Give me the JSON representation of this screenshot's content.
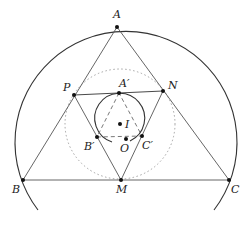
{
  "diagram": {
    "type": "geometry",
    "colors": {
      "stroke": "#333333",
      "dotted": "#999999",
      "point": "#111111"
    },
    "points": [
      {
        "id": "A",
        "label": "A",
        "x": 117,
        "y": 27,
        "lx": 113,
        "ly": 9
      },
      {
        "id": "B",
        "label": "B",
        "x": 23,
        "y": 180,
        "lx": 12,
        "ly": 184
      },
      {
        "id": "C",
        "label": "C",
        "x": 229,
        "y": 180,
        "lx": 231,
        "ly": 184
      },
      {
        "id": "M",
        "label": "M",
        "x": 121,
        "y": 180,
        "lx": 116,
        "ly": 184
      },
      {
        "id": "P",
        "label": "P",
        "x": 74,
        "y": 95,
        "lx": 63,
        "ly": 82
      },
      {
        "id": "N",
        "label": "N",
        "x": 163,
        "y": 91,
        "lx": 168,
        "ly": 80
      },
      {
        "id": "A1",
        "label": "A′",
        "x": 119,
        "y": 93,
        "lx": 119,
        "ly": 79
      },
      {
        "id": "B1",
        "label": "B′",
        "x": 97,
        "y": 137,
        "lx": 84,
        "ly": 142
      },
      {
        "id": "C1",
        "label": "C′",
        "x": 142,
        "y": 136,
        "lx": 142,
        "ly": 140
      },
      {
        "id": "I",
        "label": "I",
        "x": 120,
        "y": 124,
        "lx": 125,
        "ly": 119
      },
      {
        "id": "O",
        "label": "O",
        "x": 126,
        "y": 139,
        "lx": 120,
        "ly": 144
      }
    ]
  }
}
